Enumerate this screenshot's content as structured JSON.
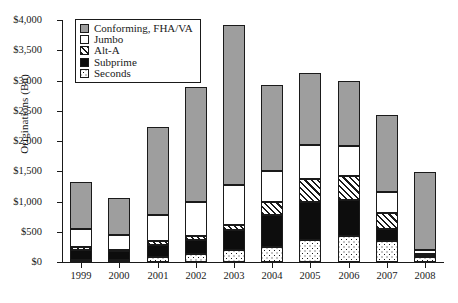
{
  "chart_data": {
    "type": "bar",
    "subtype": "stacked",
    "title": "",
    "xlabel": "",
    "ylabel": "Originations (Bn)",
    "categories": [
      "1999",
      "2000",
      "2001",
      "2002",
      "2003",
      "2004",
      "2005",
      "2006",
      "2007",
      "2008"
    ],
    "ylim": [
      0,
      4000
    ],
    "ytick_values": [
      0,
      500,
      1000,
      1500,
      2000,
      2500,
      3000,
      3500,
      4000
    ],
    "ytick_labels": [
      "$0",
      "$500",
      "$1,000",
      "$1,500",
      "$2,000",
      "$2,500",
      "$3,000",
      "$3,500",
      "$4,000"
    ],
    "grid": false,
    "legend_position": "upper-left-inside",
    "stack_order_bottom_to_top": [
      "Seconds",
      "Subprime",
      "Alt-A",
      "Jumbo",
      "Conforming, FHA/VA"
    ],
    "series": [
      {
        "name": "Seconds",
        "fill": "dotted",
        "values": [
          35,
          40,
          90,
          130,
          200,
          245,
          365,
          430,
          345,
          75
        ]
      },
      {
        "name": "Subprime",
        "fill": "solid-black",
        "values": [
          160,
          140,
          190,
          230,
          335,
          540,
          625,
          600,
          195,
          25
        ]
      },
      {
        "name": "Alt-A",
        "fill": "hatched",
        "values": [
          55,
          25,
          60,
          70,
          85,
          200,
          380,
          400,
          275,
          30
        ]
      },
      {
        "name": "Jumbo",
        "fill": "white",
        "values": [
          300,
          240,
          430,
          570,
          655,
          515,
          570,
          480,
          350,
          65
        ]
      },
      {
        "name": "Conforming, FHA/VA",
        "fill": "gray",
        "values": [
          770,
          610,
          1455,
          1885,
          2650,
          1430,
          1180,
          1075,
          1265,
          1295
        ]
      }
    ],
    "totals": [
      1320,
      1055,
      2225,
      2885,
      3925,
      2930,
      3120,
      2985,
      2430,
      1490
    ],
    "colors": {
      "conforming": "#9e9e9e",
      "jumbo": "#ffffff",
      "alt_a": "#ffffff",
      "subprime": "#0d0d0d",
      "seconds": "#ffffff",
      "outline": "#1a1a1a"
    }
  },
  "legend": {
    "items": [
      {
        "label": "Conforming, FHA/VA",
        "key": "conforming"
      },
      {
        "label": "Jumbo",
        "key": "jumbo"
      },
      {
        "label": "Alt-A",
        "key": "alta"
      },
      {
        "label": "Subprime",
        "key": "subprime"
      },
      {
        "label": "Seconds",
        "key": "seconds"
      }
    ]
  }
}
